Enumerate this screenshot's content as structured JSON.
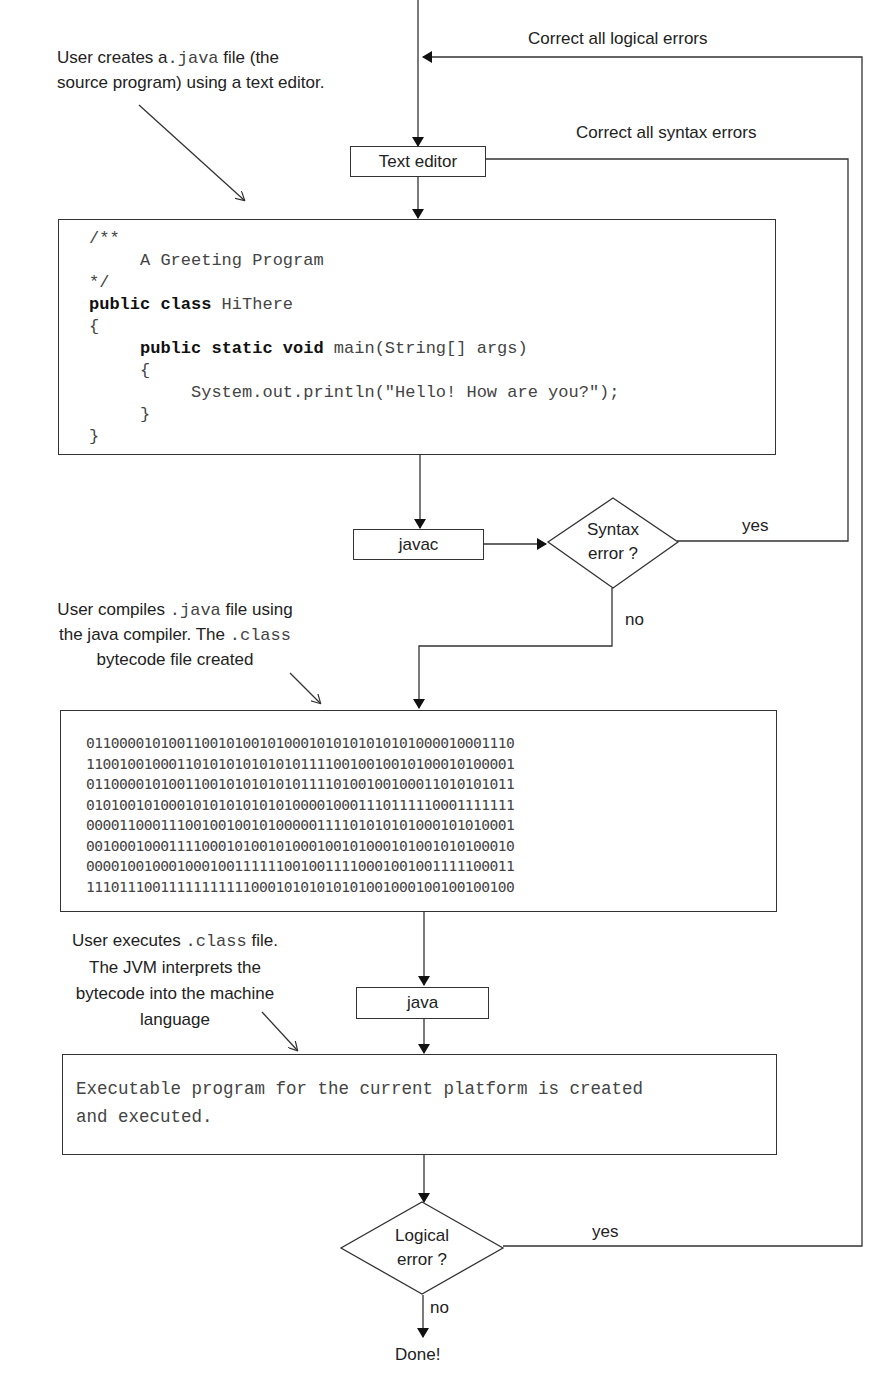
{
  "annotations": {
    "create": {
      "line1_prefix": "User creates a",
      "line1_code": ".java",
      "line1_suffix": " file (the",
      "line2": "source program) using a text editor."
    },
    "compile": {
      "line1_prefix": "User compiles ",
      "line1_code": ".java",
      "line1_suffix": " file using",
      "line2_prefix": "the java compiler. The ",
      "line2_code": ".class",
      "line3": "bytecode file created"
    },
    "execute": {
      "line1_prefix": "User executes ",
      "line1_code": ".class",
      "line1_suffix": " file.",
      "line2": "The JVM interprets the",
      "line3": "bytecode into  the machine",
      "line4": "language"
    }
  },
  "loops": {
    "logical": "Correct  all logical errors",
    "syntax": "Correct  all syntax errors"
  },
  "nodes": {
    "text_editor": "Text editor",
    "javac": "javac",
    "java": "java",
    "syntax_decision": {
      "line1": "Syntax",
      "line2": "error ?",
      "yes": "yes",
      "no": "no"
    },
    "logical_decision": {
      "line1": "Logical",
      "line2": "error ?",
      "yes": "yes",
      "no": "no"
    },
    "done": "Done!"
  },
  "source_code": {
    "lines": [
      "/**",
      "     A Greeting Program",
      "*/",
      "public class HiThere",
      "{",
      "     public static void main(String[] args)",
      "     {",
      "          System.out.println(\"Hello! How are you?\");",
      "     }",
      "}"
    ]
  },
  "bytecode": {
    "lines": [
      "0110000101001100101001010001010101010101000010001110",
      "1100100100011010101010101011110010010010100010100001",
      "0110000101001100101010101011110100100100011010101011",
      "0101001010001010101010101000010001110111110001111111",
      "0000110001110010010010100000111101010101000101010001",
      "0010001000111100010100101000100101000101001010100010",
      "0000100100010001001111110010011110001001001111100011",
      "1110111001111111111100010101010101001000100100100100"
    ]
  },
  "executable": {
    "line1": "Executable program for the current platform is created",
    "line2": "and executed."
  }
}
